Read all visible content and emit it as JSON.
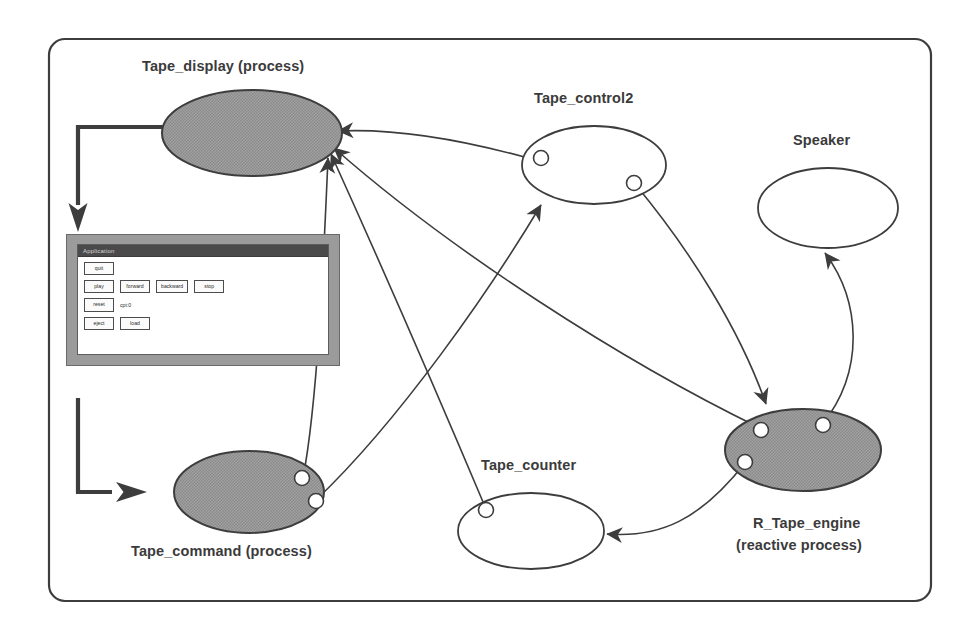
{
  "diagram": {
    "frame": {
      "shape": "rounded-rectangle",
      "stroke": "#3d3d3d"
    },
    "colors": {
      "node_fill_shaded": "#9a9a9a",
      "node_fill_plain": "#ffffff",
      "stroke": "#3d3d3d",
      "text": "#3b3b3b",
      "window_chrome": "#9b9b9b",
      "window_titlebar": "#4a4a4a"
    },
    "nodes": [
      {
        "id": "tape_display",
        "label": "Tape_display (process)",
        "kind": "process",
        "fill": "shaded",
        "ports": 0
      },
      {
        "id": "tape_control2",
        "label": "Tape_control2",
        "kind": "plain",
        "fill": "plain",
        "ports": 2
      },
      {
        "id": "speaker",
        "label": "Speaker",
        "kind": "plain",
        "fill": "plain",
        "ports": 0
      },
      {
        "id": "tape_command",
        "label": "Tape_command (process)",
        "kind": "process",
        "fill": "shaded",
        "ports": 2
      },
      {
        "id": "tape_counter",
        "label": "Tape_counter",
        "kind": "plain",
        "fill": "plain",
        "ports": 1
      },
      {
        "id": "r_tape_engine",
        "label": "R_Tape_engine\n(reactive process)",
        "kind": "reactive process",
        "fill": "shaded",
        "ports": 3
      }
    ],
    "node_labels": {
      "tape_display": "Tape_display (process)",
      "tape_control2": "Tape_control2",
      "speaker": "Speaker",
      "tape_command": "Tape_command (process)",
      "tape_counter": "Tape_counter",
      "r_tape_engine_line1": "R_Tape_engine",
      "r_tape_engine_line2": "(reactive process)"
    },
    "edges": [
      {
        "from": "tape_control2",
        "to": "tape_display",
        "style": "curve-arrow"
      },
      {
        "from": "r_tape_engine",
        "to": "tape_display",
        "style": "curve-arrow"
      },
      {
        "from": "tape_command",
        "to": "tape_display",
        "style": "curve-arrow"
      },
      {
        "from": "tape_counter",
        "to": "tape_display",
        "style": "curve-arrow"
      },
      {
        "from": "tape_command",
        "to": "tape_control2",
        "style": "curve-arrow"
      },
      {
        "from": "tape_control2",
        "to": "r_tape_engine",
        "style": "curve-arrow"
      },
      {
        "from": "r_tape_engine",
        "to": "speaker",
        "style": "curve-arrow"
      },
      {
        "from": "r_tape_engine",
        "to": "tape_counter",
        "style": "curve-arrow"
      },
      {
        "from": "tape_command",
        "to": "gui_window",
        "style": "thick-elbow-arrow"
      },
      {
        "from": "gui_window",
        "to": "tape_command",
        "style": "thick-elbow-arrow"
      }
    ]
  },
  "gui_window": {
    "title": "Application",
    "rows": [
      {
        "buttons": [
          "quit"
        ],
        "label": ""
      },
      {
        "buttons": [
          "play",
          "forward",
          "backward",
          "stop"
        ],
        "label": ""
      },
      {
        "buttons": [
          "reset"
        ],
        "label": "cpt:0"
      },
      {
        "buttons": [
          "eject",
          "load"
        ],
        "label": ""
      }
    ],
    "buttons": {
      "quit": "quit",
      "play": "play",
      "forward": "forward",
      "backward": "backward",
      "stop": "stop",
      "reset": "reset",
      "eject": "eject",
      "load": "load"
    },
    "counter_label": "cpt:0"
  }
}
